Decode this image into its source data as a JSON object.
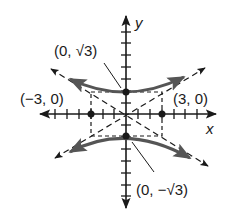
{
  "diagram": {
    "type": "hyperbola",
    "equation_form": "y^2/3 - x^2/9 = 1",
    "axes": {
      "x_label": "x",
      "y_label": "y"
    },
    "labels": {
      "top_vertex": "(0, √3)",
      "bottom_vertex": "(0, −√3)",
      "left_point": "(−3, 0)",
      "right_point": "(3, 0)"
    },
    "points": [
      {
        "name": "top-vertex",
        "x": 0,
        "y": 1.732
      },
      {
        "name": "bottom-vertex",
        "x": 0,
        "y": -1.732
      },
      {
        "name": "left-point",
        "x": -3,
        "y": 0
      },
      {
        "name": "right-point",
        "x": 3,
        "y": 0
      }
    ],
    "asymptotes": [
      "y = x/√3",
      "y = -x/√3"
    ],
    "tick_range": {
      "x": [
        -6,
        6
      ],
      "y": [
        -7,
        7
      ]
    },
    "colors": {
      "ink": "#1a1a1a",
      "curve": "#555555"
    }
  }
}
